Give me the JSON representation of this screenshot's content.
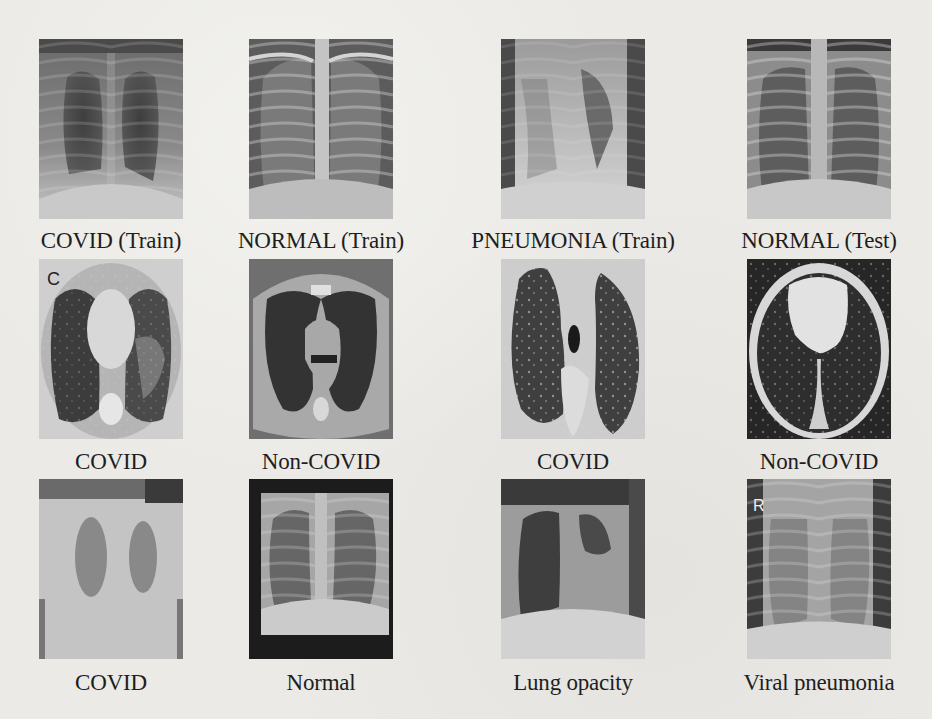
{
  "figure": {
    "rows": [
      {
        "modality": "chest X-ray",
        "items": [
          {
            "caption": "COVID (Train)",
            "image": "chest-xray-covid-train"
          },
          {
            "caption": "NORMAL (Train)",
            "image": "chest-xray-normal-train"
          },
          {
            "caption": "PNEUMONIA (Train)",
            "image": "chest-xray-pneumonia-train"
          },
          {
            "caption": "NORMAL (Test)",
            "image": "chest-xray-normal-test"
          }
        ]
      },
      {
        "modality": "chest CT",
        "items": [
          {
            "caption": "COVID",
            "image": "chest-ct-covid",
            "overlay_text": "C"
          },
          {
            "caption": "Non-COVID",
            "image": "chest-ct-non-covid"
          },
          {
            "caption": "COVID",
            "image": "chest-ct-covid-2"
          },
          {
            "caption": "Non-COVID",
            "image": "chest-ct-non-covid-2"
          }
        ]
      },
      {
        "modality": "chest X-ray",
        "items": [
          {
            "caption": "COVID",
            "image": "chest-xray-covid"
          },
          {
            "caption": "Normal",
            "image": "chest-xray-normal"
          },
          {
            "caption": "Lung opacity",
            "image": "chest-xray-lung-opacity"
          },
          {
            "caption": "Viral pneumonia",
            "image": "chest-xray-viral-pneumonia",
            "overlay_text": "R"
          }
        ]
      }
    ]
  },
  "colors": {
    "background": "#ebeae6",
    "caption_text": "#1e1e1e"
  }
}
